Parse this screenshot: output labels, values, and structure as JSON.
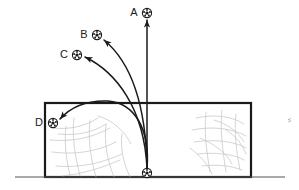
{
  "figure": {
    "type": "physics-trajectory-diagram",
    "width": 299,
    "height": 190,
    "background_color": "#ffffff",
    "ink_color": "#1a1a1a",
    "texture_color": "#c9c9cf"
  },
  "ground": {
    "name": "ground-line",
    "x1": 15,
    "y1": 177,
    "x2": 285,
    "y2": 177,
    "color": "#55555a",
    "stroke_width": 1.2
  },
  "wall": {
    "name": "wall-rectangle",
    "x": 45,
    "y": 103,
    "width": 206,
    "height": 74,
    "stroke_color": "#1a1a1a",
    "stroke_width": 2.2,
    "fill": "none"
  },
  "origin_ball": {
    "label": "",
    "cx": 147,
    "cy": 173,
    "r": 4.6
  },
  "balls": [
    {
      "id": "A",
      "label": "A",
      "cx": 147,
      "cy": 13,
      "r": 4.6,
      "label_x": 134,
      "label_y": 13
    },
    {
      "id": "B",
      "label": "B",
      "cx": 97,
      "cy": 35,
      "r": 4.6,
      "label_x": 84,
      "label_y": 35
    },
    {
      "id": "C",
      "label": "C",
      "cx": 77,
      "cy": 55,
      "r": 4.6,
      "label_x": 64,
      "label_y": 55
    },
    {
      "id": "D",
      "label": "D",
      "cx": 53,
      "cy": 123,
      "r": 4.6,
      "label_x": 39,
      "label_y": 123
    }
  ],
  "trajectories": [
    {
      "id": "A",
      "name": "trajectory-a",
      "kind": "straight",
      "description": "straight vertical rise with no curve",
      "path": "M 147 168 L 147 20",
      "stroke_width": 1.5
    },
    {
      "id": "B",
      "name": "trajectory-b",
      "kind": "curved",
      "description": "slightly curved arc bending left to ball B",
      "path": "M 147 168 C 146 110 133 64 104 40",
      "stroke_width": 1.5
    },
    {
      "id": "C",
      "name": "trajectory-c",
      "kind": "curved",
      "description": "more strongly curved arc bending left to ball C",
      "path": "M 147 168 C 144 108 116 72 85 57",
      "stroke_width": 1.5
    },
    {
      "id": "D",
      "name": "trajectory-d",
      "kind": "curved-over-wall",
      "description": "high arc rising over the top edge of the wall and dropping to ball D",
      "path": "M 147 168 C 150 130 135 103 108 101 C 82 100 68 110 60 119",
      "stroke_width": 1.6
    }
  ],
  "arrowheads": [
    {
      "id": "A",
      "name": "arrowhead-a",
      "x": 147,
      "y": 20,
      "angle": -90
    },
    {
      "id": "B",
      "name": "arrowhead-b",
      "x": 104,
      "y": 40,
      "angle": -140
    },
    {
      "id": "C",
      "name": "arrowhead-c",
      "x": 85,
      "y": 57,
      "angle": -155
    },
    {
      "id": "D",
      "name": "arrowhead-d",
      "x": 60,
      "y": 119,
      "angle": 132
    }
  ],
  "wall_texture": {
    "name": "wall-texture",
    "description": "faint gray irregular lines suggesting a crowd or brickwork inside the wall",
    "color": "#c9c9cf",
    "stroke_width": 0.8,
    "left_cluster": [
      "M 52 128 C 70 130 86 126 98 118",
      "M 50 140 C 72 142 92 138 110 128",
      "M 52 152 C 74 155 96 152 116 142",
      "M 56 166 C 78 168 100 164 122 154",
      "M 62 176 C 82 174 102 168 120 160",
      "M 74 118 C 72 134 74 152 80 176",
      "M 90 120 C 88 138 90 156 96 177",
      "M 106 124 C 104 142 107 160 114 177",
      "M 122 134 C 120 150 124 164 130 177",
      "M 66 126 C 64 142 66 158 70 176",
      "M 98 116 C 112 120 124 130 131 144",
      "M 58 134 C 78 136 94 132 106 124"
    ],
    "right_cluster": [
      "M 196 118 C 214 114 232 116 244 124",
      "M 192 130 C 212 126 232 128 246 136",
      "M 194 142 C 214 139 234 141 246 148",
      "M 198 154 C 216 152 234 154 244 160",
      "M 202 166 C 218 164 232 166 242 170",
      "M 206 112 C 204 130 206 148 210 172",
      "M 222 110 C 220 128 222 146 226 172",
      "M 236 114 C 234 132 236 150 240 170",
      "M 214 120 C 228 124 238 132 244 142",
      "M 200 138 C 214 144 226 152 232 164",
      "M 226 130 C 236 136 242 144 246 154",
      "M 190 148 C 200 156 208 164 212 174"
    ]
  },
  "stray_mark": {
    "name": "stray-mark",
    "x": 288,
    "y": 120,
    "color": "#9a9aa0"
  }
}
